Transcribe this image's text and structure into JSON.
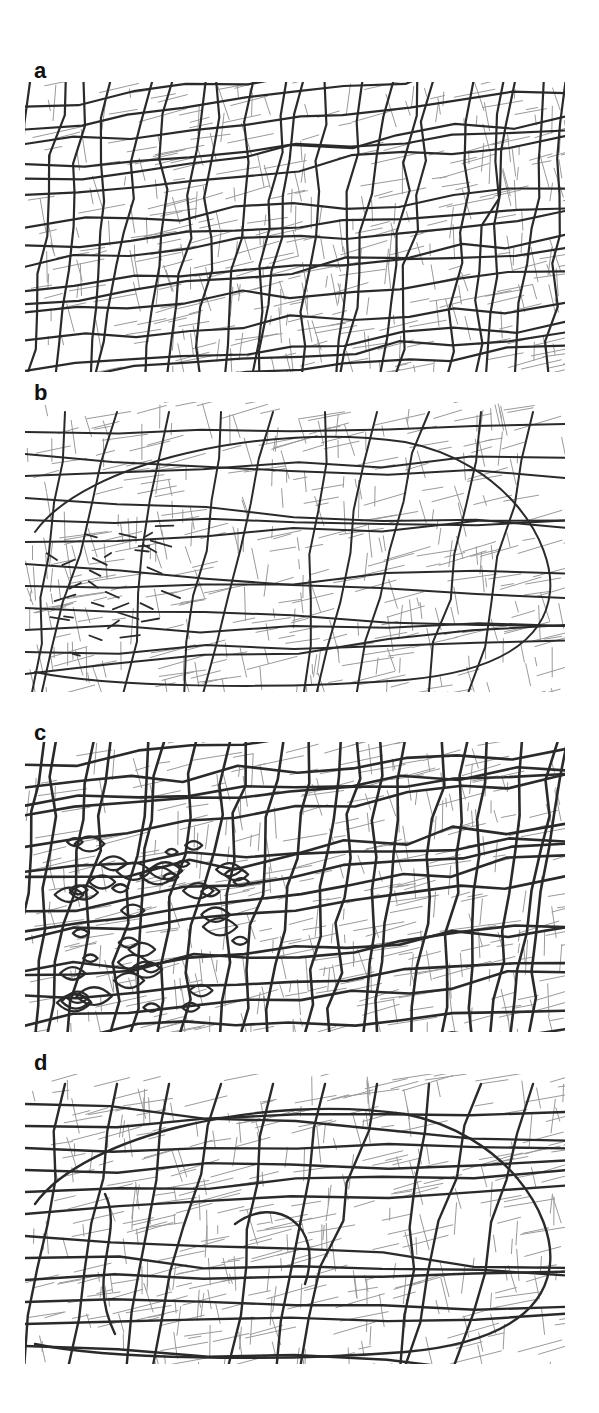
{
  "figure": {
    "panels": [
      {
        "label": "a",
        "top": 60,
        "map_top": 22,
        "map_height": 300,
        "style": "grid-dense",
        "seed": 11
      },
      {
        "label": "b",
        "top": 382,
        "map_top": 20,
        "map_height": 300,
        "style": "ring",
        "seed": 23
      },
      {
        "label": "c",
        "top": 722,
        "map_top": 20,
        "map_height": 300,
        "style": "cells",
        "seed": 37
      },
      {
        "label": "d",
        "top": 1052,
        "map_top": 22,
        "map_height": 300,
        "style": "arterial",
        "seed": 53
      }
    ],
    "colors": {
      "background": "#ffffff",
      "minor_street": "#9a9a9a",
      "major_street": "#2a2a2a",
      "label": "#111111"
    }
  }
}
